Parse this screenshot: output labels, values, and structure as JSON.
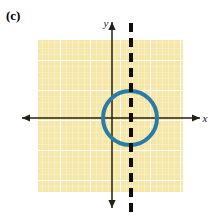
{
  "figure": {
    "part_label": "(c)",
    "background_color": "#ffffff"
  },
  "grid": {
    "fill_color": "#f4e7a9",
    "minor_line_color": "#fdf6d2",
    "major_line_color": "#ffffff",
    "x": 38,
    "y": 40,
    "width": 145,
    "height": 152,
    "minor_spacing": 6,
    "major_spacing": 30
  },
  "axes": {
    "color": "#262010",
    "x_axis": {
      "label": "x",
      "label_x": 205,
      "label_y": 122,
      "y_position": 118,
      "x_start": 22,
      "x_end": 200,
      "arrow_left": true,
      "arrow_right": true
    },
    "y_axis": {
      "label": "y",
      "label_x": 106,
      "label_y": 27,
      "x_position": 112,
      "y_start": 22,
      "y_end": 208,
      "arrow_up": true,
      "arrow_down": true
    },
    "origin": {
      "x": 112,
      "y": 118
    }
  },
  "circle": {
    "center_x": 130,
    "center_y": 118,
    "radius": 27,
    "stroke_color": "#2a7ca6",
    "stroke_width": 4,
    "fill": "none"
  },
  "dashed_line": {
    "x_position": 131,
    "y_start": 23,
    "y_end": 212,
    "stroke_color": "#0d0d0d",
    "stroke_width": 4,
    "dash_on": 9,
    "dash_off": 6,
    "orientation": "vertical"
  }
}
